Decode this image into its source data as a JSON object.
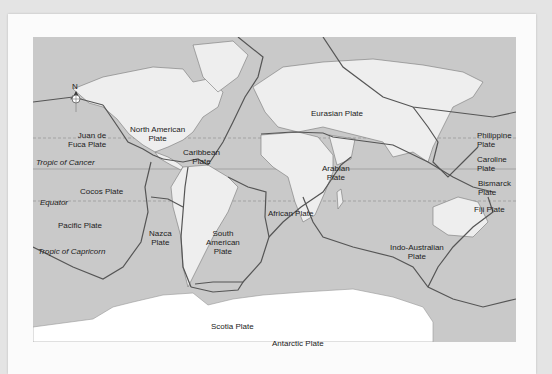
{
  "map": {
    "title": "Tectonic Plates",
    "compass": {
      "north_label": "N"
    },
    "colors": {
      "ocean": "#c9c9c9",
      "land": "#eeeeee",
      "antarctica": "#ffffff",
      "boundary": "#555555",
      "page": "#fbfbfb"
    },
    "reference_lines": {
      "tropic_of_cancer": "Tropic of Cancer",
      "equator": "Equator",
      "tropic_of_capricorn": "Tropic of Capricorn"
    },
    "plates": {
      "juan_de_fuca": [
        "Juan de",
        "Fuca Plate"
      ],
      "north_american": [
        "North American",
        "Plate"
      ],
      "caribbean": [
        "Caribbean",
        "Plate"
      ],
      "cocos": "Cocos Plate",
      "pacific": "Pacific Plate",
      "nazca": [
        "Nazca",
        "Plate"
      ],
      "south_american": [
        "South",
        "American",
        "Plate"
      ],
      "scotia": "Scotia Plate",
      "antarctic": "Antarctic Plate",
      "eurasian": "Eurasian Plate",
      "arabian": [
        "Arabian",
        "Plate"
      ],
      "african": "African Plate",
      "indo_australian": [
        "Indo-Australian",
        "Plate"
      ],
      "philippine": [
        "Philippine",
        "Plate"
      ],
      "caroline": [
        "Caroline",
        "Plate"
      ],
      "bismarck": [
        "Bismarck",
        "Plate"
      ],
      "fiji": "Fiji Plate"
    }
  }
}
